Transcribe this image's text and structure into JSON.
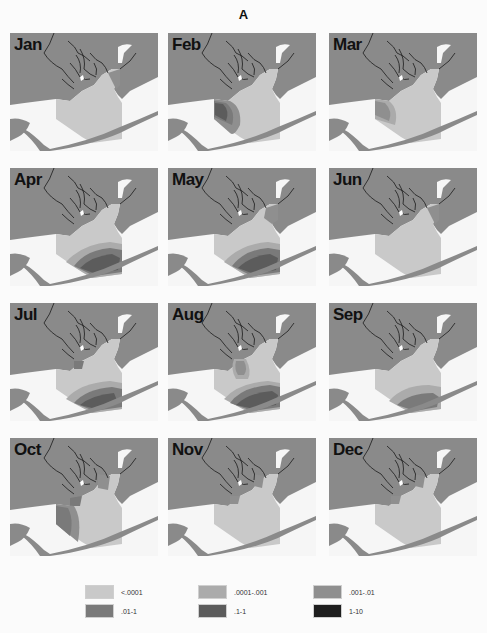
{
  "figure": {
    "title": "A"
  },
  "colors": {
    "land": "#8a8a8a",
    "water": "#f6f6f6",
    "lt0001": "#c9c9c9",
    "r0001_001": "#ababab",
    "r001_01": "#8f8f8f",
    "r01_1": "#7a7a7a",
    "r1_1": "#5c5c5c",
    "r1_10": "#1e1e1e"
  },
  "panels": [
    {
      "month": "Jan",
      "highlight": "ne-tip"
    },
    {
      "month": "Feb",
      "highlight": "west-strong"
    },
    {
      "month": "Mar",
      "highlight": "west-medium"
    },
    {
      "month": "Apr",
      "highlight": "south-strong"
    },
    {
      "month": "May",
      "highlight": "south-strong-ne"
    },
    {
      "month": "Jun",
      "highlight": "ne-tip"
    },
    {
      "month": "Jul",
      "highlight": "south-strong-delta"
    },
    {
      "month": "Aug",
      "highlight": "south-strong-center"
    },
    {
      "month": "Sep",
      "highlight": "south-medium"
    },
    {
      "month": "Oct",
      "highlight": "west-medium-delta"
    },
    {
      "month": "Nov",
      "highlight": "delta-small"
    },
    {
      "month": "Dec",
      "highlight": "delta-small"
    }
  ],
  "legend": {
    "items": [
      {
        "label": "<.0001",
        "color": "#c9c9c9"
      },
      {
        "label": ".0001-.001",
        "color": "#ababab"
      },
      {
        "label": ".001-.01",
        "color": "#8f8f8f"
      },
      {
        "label": ".01-1",
        "color": "#7a7a7a"
      },
      {
        "label": ".1-1",
        "color": "#5c5c5c"
      },
      {
        "label": "1-10",
        "color": "#1e1e1e"
      }
    ]
  }
}
